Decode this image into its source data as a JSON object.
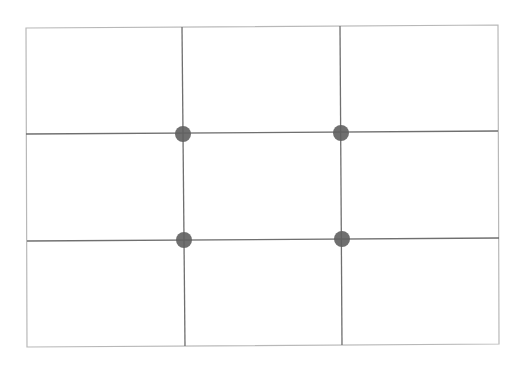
{
  "diagram": {
    "type": "rule-of-thirds-grid",
    "canvas": {
      "width": 528,
      "height": 370,
      "background": "#ffffff"
    },
    "frame": {
      "corners": [
        [
          26,
          28
        ],
        [
          498,
          25
        ],
        [
          499,
          344
        ],
        [
          27,
          347
        ]
      ],
      "color": "#b8b8b8"
    },
    "vertical_lines": [
      {
        "x1": 182,
        "y1": 27,
        "x2": 185,
        "y2": 346
      },
      {
        "x1": 340,
        "y1": 26,
        "x2": 342,
        "y2": 345
      }
    ],
    "horizontal_lines": [
      {
        "x1": 26,
        "y1": 134,
        "x2": 498,
        "y2": 131
      },
      {
        "x1": 27,
        "y1": 241,
        "x2": 499,
        "y2": 238
      }
    ],
    "grid_color": "#6f6f6f",
    "points": [
      {
        "cx": 183,
        "cy": 134,
        "r": 8
      },
      {
        "cx": 341,
        "cy": 133,
        "r": 8
      },
      {
        "cx": 184,
        "cy": 240,
        "r": 8
      },
      {
        "cx": 342,
        "cy": 239,
        "r": 8
      }
    ],
    "point_color": "#5f5f5f",
    "rows": 3,
    "columns": 3
  }
}
